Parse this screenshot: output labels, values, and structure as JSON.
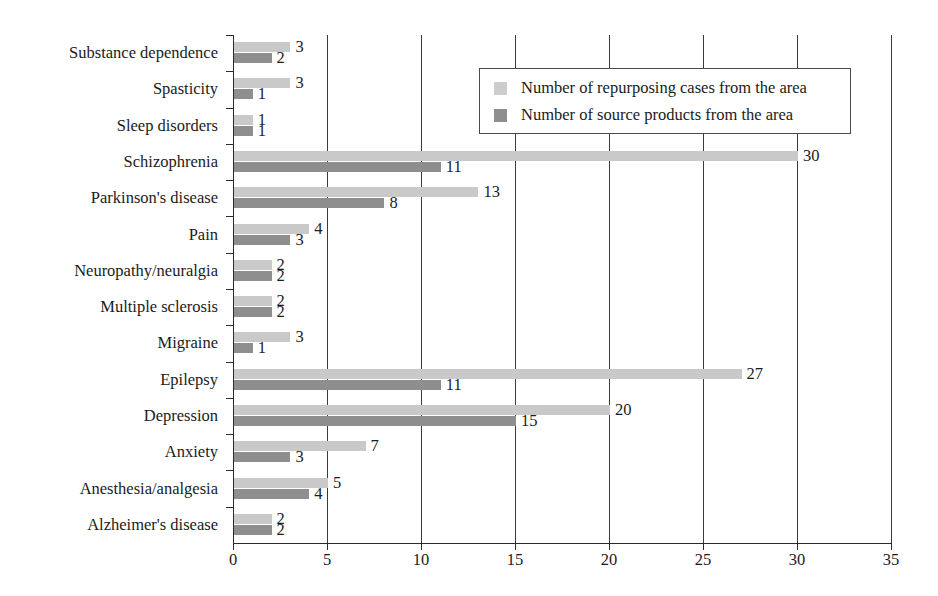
{
  "chart_data": {
    "type": "bar",
    "orientation": "horizontal",
    "title": "",
    "xlabel": "",
    "ylabel": "",
    "xlim": [
      0,
      35
    ],
    "xticks": [
      0,
      5,
      10,
      15,
      20,
      25,
      30,
      35
    ],
    "grid": "vertical",
    "legend_position": "top-right-inside",
    "categories": [
      "Substance dependence",
      "Spasticity",
      "Sleep disorders",
      "Schizophrenia",
      "Parkinson's disease",
      "Pain",
      "Neuropathy/neuralgia",
      "Multiple sclerosis",
      "Migraine",
      "Epilepsy",
      "Depression",
      "Anxiety",
      "Anesthesia/analgesia",
      "Alzheimer's disease"
    ],
    "series": [
      {
        "name": "Number of repurposing cases from the area",
        "color": "#c9c9c9",
        "values": [
          3,
          3,
          1,
          30,
          13,
          4,
          2,
          2,
          3,
          27,
          20,
          7,
          5,
          2
        ]
      },
      {
        "name": "Number of source products from the area",
        "color": "#8e8e8e",
        "values": [
          2,
          1,
          1,
          11,
          8,
          3,
          2,
          2,
          1,
          11,
          15,
          3,
          4,
          2
        ]
      }
    ]
  },
  "legend": {
    "items": [
      {
        "label": "Number of repurposing cases from the area",
        "swatch": "repurposing"
      },
      {
        "label": "Number of source products from the area",
        "swatch": "source"
      }
    ]
  },
  "axis": {
    "x_tick_labels": [
      "0",
      "5",
      "10",
      "15",
      "20",
      "25",
      "30",
      "35"
    ]
  },
  "colors": {
    "repurposing": "#c9c9c9",
    "source": "#8e8e8e",
    "axis": "#2b2b2b",
    "text": "#1b1b1b",
    "background": "#ffffff"
  }
}
